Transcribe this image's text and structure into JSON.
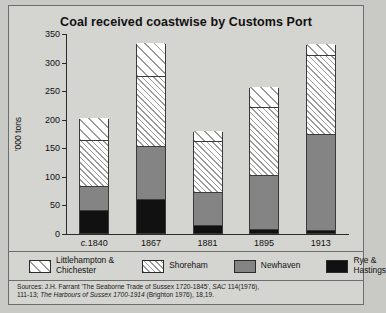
{
  "chart_data": {
    "type": "bar",
    "subtype": "stacked",
    "title": "Coal received coastwise by Customs Port",
    "xlabel": "",
    "ylabel": "'000 tons",
    "categories": [
      "c.1840",
      "1867",
      "1881",
      "1895",
      "1913"
    ],
    "ylim": [
      0,
      350
    ],
    "yticks": [
      0,
      50,
      100,
      150,
      200,
      250,
      300,
      350
    ],
    "grid": false,
    "legend_position": "bottom",
    "series": [
      {
        "name": "Rye & Hastings",
        "key": "rye",
        "fill": "solid-black",
        "values": [
          38,
          58,
          12,
          5,
          3
        ]
      },
      {
        "name": "Newhaven",
        "key": "newhaven",
        "fill": "solid-grey",
        "values": [
          43,
          92,
          58,
          95,
          169
        ]
      },
      {
        "name": "Shoreham",
        "key": "shoreham",
        "fill": "dense-hatch",
        "values": [
          80,
          123,
          90,
          118,
          138
        ]
      },
      {
        "name": "Littlehampton & Chichester",
        "key": "littlehampton",
        "fill": "sparse-hatch",
        "values": [
          40,
          59,
          18,
          37,
          20
        ]
      }
    ],
    "totals": [
      201,
      332,
      178,
      255,
      330
    ],
    "colors": {
      "rye": "#111111",
      "newhaven": "#848484",
      "shoreham": "#ffffff",
      "littlehampton": "#ffffff",
      "hatch": "#9a9a9a",
      "axis": "#2b2b2b",
      "background": "#d4d4d0",
      "page": "#c9c9c5",
      "border": "#6d6d6d"
    }
  },
  "legend": {
    "items": [
      {
        "label": "Littlehampton &\nChichester",
        "swatch": "sparse-hatch"
      },
      {
        "label": "Shoreham",
        "swatch": "dense-hatch"
      },
      {
        "label": "Newhaven",
        "swatch": "solid-grey"
      },
      {
        "label": "Rye &\nHastings",
        "swatch": "solid-black"
      }
    ]
  },
  "sources": {
    "line1_a": "Sources: J.H. Farrant 'The Seaborne Trade of Sussex 1720-1845', ",
    "line1_b": "SAC",
    "line1_c": " 114(1976),",
    "line2_a": "111-13; ",
    "line2_b": "The Harbours of Sussex 1700-1914",
    "line2_c": " (Brighton 1976), 18,19."
  },
  "axis": {
    "tick_labels": [
      "0",
      "50",
      "100",
      "150",
      "200",
      "250",
      "300",
      "350"
    ]
  }
}
